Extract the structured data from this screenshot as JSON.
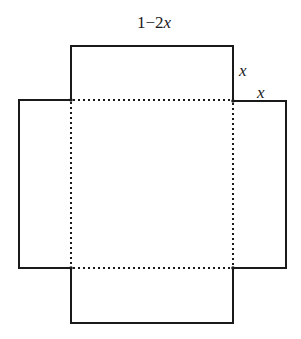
{
  "diagram": {
    "type": "box-net",
    "labels": {
      "top_length_prefix": "1−2",
      "top_length_var": "x",
      "flap_height": "x",
      "flap_width": "x"
    },
    "colors": {
      "stroke": "#1a1a1a",
      "background": "#ffffff"
    },
    "geometry": {
      "center_square": {
        "x1": 71,
        "y1": 100,
        "x2": 233,
        "y2": 268
      },
      "top_flap": {
        "x1": 71,
        "y1": 46,
        "x2": 233,
        "y2": 100
      },
      "bottom_flap": {
        "x1": 71,
        "y1": 268,
        "x2": 233,
        "y2": 323
      },
      "left_flap": {
        "x1": 19,
        "y1": 100,
        "x2": 71,
        "y2": 268
      },
      "right_flap": {
        "x1": 233,
        "y1": 101,
        "x2": 286,
        "y2": 268
      }
    }
  }
}
